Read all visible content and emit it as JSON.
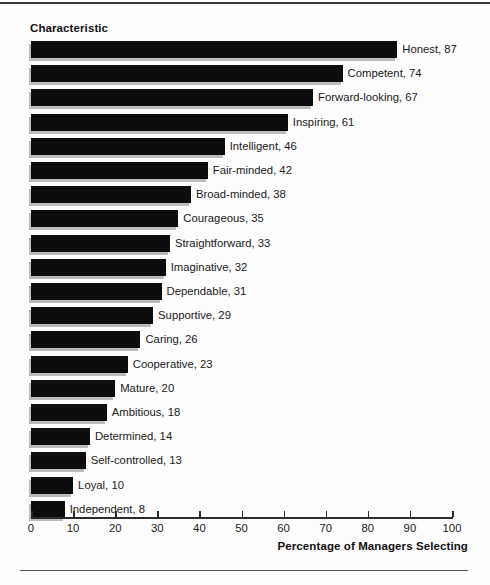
{
  "chart_data": {
    "type": "bar",
    "orientation": "horizontal",
    "title": "Characteristic",
    "xlabel": "Percentage of Managers Selecting",
    "ylabel": "",
    "xlim": [
      0,
      100
    ],
    "xticks": [
      0,
      10,
      20,
      30,
      40,
      50,
      60,
      70,
      80,
      90,
      100
    ],
    "grid": false,
    "legend": null,
    "bar_color": "#0d0d0d",
    "shadow_color": "#bcbcbc",
    "categories": [
      "Honest",
      "Competent",
      "Forward-looking",
      "Inspiring",
      "Intelligent",
      "Fair-minded",
      "Broad-minded",
      "Courageous",
      "Straightforward",
      "Imaginative",
      "Dependable",
      "Supportive",
      "Caring",
      "Cooperative",
      "Mature",
      "Ambitious",
      "Determined",
      "Self-controlled",
      "Loyal",
      "Independent"
    ],
    "values": [
      87,
      74,
      67,
      61,
      46,
      42,
      38,
      35,
      33,
      32,
      31,
      29,
      26,
      23,
      20,
      18,
      14,
      13,
      10,
      8
    ],
    "data_labels": [
      "Honest, 87",
      "Competent, 74",
      "Forward-looking, 67",
      "Inspiring, 61",
      "Intelligent, 46",
      "Fair-minded, 42",
      "Broad-minded, 38",
      "Courageous, 35",
      "Straightforward, 33",
      "Imaginative, 32",
      "Dependable, 31",
      "Supportive, 29",
      "Caring, 26",
      "Cooperative, 23",
      "Mature, 20",
      "Ambitious, 18",
      "Determined, 14",
      "Self-controlled, 13",
      "Loyal, 10",
      "Independent, 8"
    ]
  }
}
